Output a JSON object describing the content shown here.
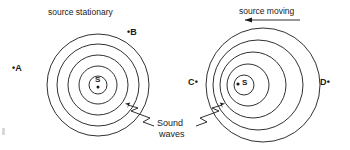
{
  "diagram": {
    "title_left": "source stationary",
    "title_right": "source moving",
    "wave_label_line1": "Sound",
    "wave_label_line2": "waves",
    "stroke_color": "#1a1a1a",
    "background_color": "#ffffff"
  },
  "left_panel": {
    "heading": "source stationary",
    "source_letter": "S",
    "source_name": "stationary-source",
    "center": {
      "cx": 98,
      "cy": 85
    },
    "radii": [
      9,
      19,
      30,
      41,
      51
    ],
    "points": [
      {
        "id": "A",
        "label": "•A",
        "x": 14,
        "y": 64,
        "dot_side": "left"
      },
      {
        "id": "B",
        "label": "•B",
        "x": 128,
        "y": 28,
        "dot_side": "left"
      }
    ]
  },
  "right_panel": {
    "heading": "source moving",
    "motion_arrow": "arrow-left",
    "motion_direction": "left",
    "source_letter": "S",
    "source_name": "moving-source",
    "center": {
      "cx": 243,
      "cy": 85
    },
    "wavefronts": [
      {
        "r": 10,
        "offset": 1
      },
      {
        "r": 21,
        "offset": 5
      },
      {
        "r": 33,
        "offset": 10
      },
      {
        "r": 45,
        "offset": 15
      },
      {
        "r": 57,
        "offset": 20
      }
    ],
    "points": [
      {
        "id": "C",
        "label": "C•",
        "x": 190,
        "y": 78,
        "dot_side": "right"
      },
      {
        "id": "D",
        "label": "D•",
        "x": 322,
        "y": 78,
        "dot_side": "right"
      }
    ]
  },
  "annotation": {
    "text_line1": "Sound",
    "text_line2": "waves",
    "leader_left_name": "leader-to-left-wavefront",
    "leader_right_name": "leader-to-right-wavefront"
  }
}
